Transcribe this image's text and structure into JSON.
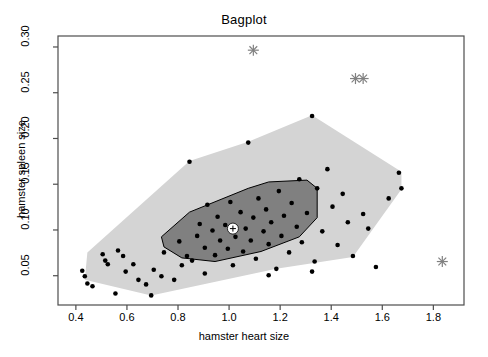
{
  "chart_data": {
    "type": "scatter",
    "title": "Bagplot",
    "xlabel": "hamster heart size",
    "ylabel": "hamster spleen size",
    "xlim": [
      0.33,
      1.92
    ],
    "ylim": [
      0.018,
      0.312
    ],
    "xticks": [
      0.4,
      0.6,
      0.8,
      1.0,
      1.2,
      1.4,
      1.6,
      1.8
    ],
    "xticklabels": [
      "0.4",
      "0.6",
      "0.8",
      "1.0",
      "1.2",
      "1.4",
      "1.6",
      "1.8"
    ],
    "yticks": [
      0.05,
      0.1,
      0.15,
      0.2,
      0.25,
      0.3
    ],
    "yticklabels": [
      "0.05",
      "0.10",
      "0.15",
      "0.20",
      "0.25",
      "0.30"
    ],
    "grid": false,
    "legend": null,
    "colors": {
      "loop_fill": "#d4d4d4",
      "bag_fill": "#808080",
      "bag_border": "#000000",
      "point": "#000000",
      "outlier": "#808080",
      "frame": "#4d4d4d",
      "median_fill": "#ffffff"
    },
    "depth_median": {
      "x": 1.015,
      "y": 0.1015
    },
    "outliers": [
      {
        "x": 1.095,
        "y": 0.2965
      },
      {
        "x": 1.495,
        "y": 0.2655
      },
      {
        "x": 1.525,
        "y": 0.2655
      },
      {
        "x": 1.835,
        "y": 0.0655
      }
    ],
    "points": [
      {
        "x": 0.425,
        "y": 0.0555
      },
      {
        "x": 0.435,
        "y": 0.0495
      },
      {
        "x": 0.445,
        "y": 0.0415
      },
      {
        "x": 0.505,
        "y": 0.0735
      },
      {
        "x": 0.515,
        "y": 0.0665
      },
      {
        "x": 0.525,
        "y": 0.0625
      },
      {
        "x": 0.555,
        "y": 0.0305
      },
      {
        "x": 0.595,
        "y": 0.0545
      },
      {
        "x": 0.625,
        "y": 0.0625
      },
      {
        "x": 0.645,
        "y": 0.0455
      },
      {
        "x": 0.675,
        "y": 0.0405
      },
      {
        "x": 0.705,
        "y": 0.0565
      },
      {
        "x": 0.735,
        "y": 0.0495
      },
      {
        "x": 0.745,
        "y": 0.0755
      },
      {
        "x": 0.785,
        "y": 0.0455
      },
      {
        "x": 0.805,
        "y": 0.0875
      },
      {
        "x": 0.815,
        "y": 0.0615
      },
      {
        "x": 0.835,
        "y": 0.0715
      },
      {
        "x": 0.845,
        "y": 0.1745
      },
      {
        "x": 0.855,
        "y": 0.0665
      },
      {
        "x": 0.875,
        "y": 0.0935
      },
      {
        "x": 0.885,
        "y": 0.1065
      },
      {
        "x": 0.905,
        "y": 0.0805
      },
      {
        "x": 0.915,
        "y": 0.1275
      },
      {
        "x": 0.935,
        "y": 0.0995
      },
      {
        "x": 0.945,
        "y": 0.0725
      },
      {
        "x": 0.955,
        "y": 0.1145
      },
      {
        "x": 0.965,
        "y": 0.0885
      },
      {
        "x": 0.985,
        "y": 0.1055
      },
      {
        "x": 0.995,
        "y": 0.0795
      },
      {
        "x": 1.005,
        "y": 0.1305
      },
      {
        "x": 1.015,
        "y": 0.0615
      },
      {
        "x": 1.025,
        "y": 0.0925
      },
      {
        "x": 1.045,
        "y": 0.1195
      },
      {
        "x": 1.055,
        "y": 0.0765
      },
      {
        "x": 1.065,
        "y": 0.1015
      },
      {
        "x": 1.075,
        "y": 0.1955
      },
      {
        "x": 1.085,
        "y": 0.0885
      },
      {
        "x": 1.095,
        "y": 0.1135
      },
      {
        "x": 1.105,
        "y": 0.0685
      },
      {
        "x": 1.115,
        "y": 0.1345
      },
      {
        "x": 1.135,
        "y": 0.0985
      },
      {
        "x": 1.145,
        "y": 0.1225
      },
      {
        "x": 1.155,
        "y": 0.0845
      },
      {
        "x": 1.165,
        "y": 0.1085
      },
      {
        "x": 1.185,
        "y": 0.0575
      },
      {
        "x": 1.195,
        "y": 0.1425
      },
      {
        "x": 1.205,
        "y": 0.0935
      },
      {
        "x": 1.215,
        "y": 0.1155
      },
      {
        "x": 1.235,
        "y": 0.0755
      },
      {
        "x": 1.245,
        "y": 0.1295
      },
      {
        "x": 1.265,
        "y": 0.1035
      },
      {
        "x": 1.275,
        "y": 0.1555
      },
      {
        "x": 1.285,
        "y": 0.0865
      },
      {
        "x": 1.305,
        "y": 0.1185
      },
      {
        "x": 1.325,
        "y": 0.2245
      },
      {
        "x": 1.335,
        "y": 0.0655
      },
      {
        "x": 1.345,
        "y": 0.1455
      },
      {
        "x": 1.365,
        "y": 0.0985
      },
      {
        "x": 1.385,
        "y": 0.1665
      },
      {
        "x": 1.405,
        "y": 0.1255
      },
      {
        "x": 1.425,
        "y": 0.0835
      },
      {
        "x": 1.445,
        "y": 0.1395
      },
      {
        "x": 1.465,
        "y": 0.1085
      },
      {
        "x": 1.485,
        "y": 0.0715
      },
      {
        "x": 1.525,
        "y": 0.1175
      },
      {
        "x": 1.545,
        "y": 0.1015
      },
      {
        "x": 1.575,
        "y": 0.0595
      },
      {
        "x": 1.625,
        "y": 0.1345
      },
      {
        "x": 1.665,
        "y": 0.1625
      },
      {
        "x": 1.675,
        "y": 0.1455
      },
      {
        "x": 0.465,
        "y": 0.0385
      },
      {
        "x": 0.565,
        "y": 0.0775
      },
      {
        "x": 0.585,
        "y": 0.0715
      },
      {
        "x": 0.905,
        "y": 0.0525
      },
      {
        "x": 1.155,
        "y": 0.0505
      },
      {
        "x": 1.325,
        "y": 0.0545
      },
      {
        "x": 0.695,
        "y": 0.0285
      }
    ],
    "loop_polygon": [
      {
        "x": 0.445,
        "y": 0.0755
      },
      {
        "x": 0.845,
        "y": 0.1755
      },
      {
        "x": 1.075,
        "y": 0.1965
      },
      {
        "x": 1.325,
        "y": 0.2255
      },
      {
        "x": 1.675,
        "y": 0.1635
      },
      {
        "x": 1.675,
        "y": 0.1445
      },
      {
        "x": 1.485,
        "y": 0.0705
      },
      {
        "x": 1.185,
        "y": 0.0575
      },
      {
        "x": 0.695,
        "y": 0.0285
      },
      {
        "x": 0.435,
        "y": 0.0455
      }
    ],
    "bag_polygon": [
      {
        "x": 0.735,
        "y": 0.0925
      },
      {
        "x": 0.845,
        "y": 0.1195
      },
      {
        "x": 1.075,
        "y": 0.1455
      },
      {
        "x": 1.155,
        "y": 0.1525
      },
      {
        "x": 1.305,
        "y": 0.1545
      },
      {
        "x": 1.345,
        "y": 0.1455
      },
      {
        "x": 1.345,
        "y": 0.1135
      },
      {
        "x": 1.275,
        "y": 0.0925
      },
      {
        "x": 1.125,
        "y": 0.0765
      },
      {
        "x": 0.945,
        "y": 0.0655
      },
      {
        "x": 0.815,
        "y": 0.0695
      },
      {
        "x": 0.745,
        "y": 0.0815
      }
    ]
  }
}
